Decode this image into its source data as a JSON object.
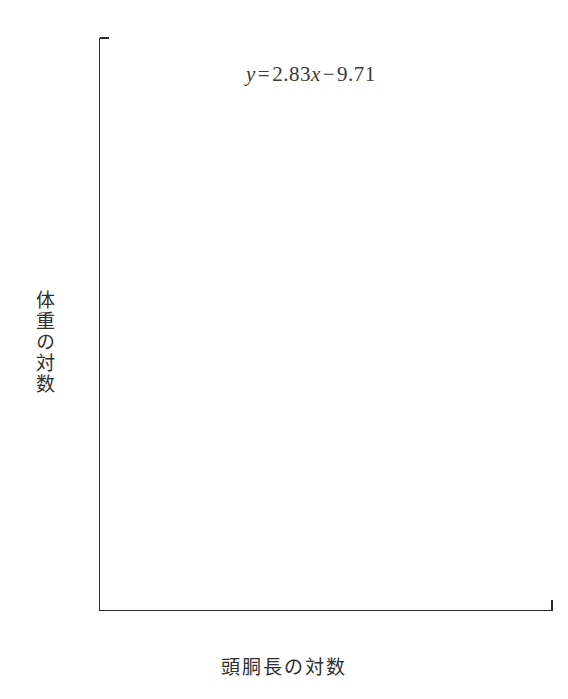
{
  "figure": {
    "width": 568,
    "height": 699,
    "background": "#ffffff",
    "ink_color": "#131313"
  },
  "annotation": {
    "equation_full": "y = 2.83x − 9.71",
    "lhs": "y",
    "equals": "=",
    "slope": "2.83",
    "variable": "x",
    "minus": "−",
    "intercept": "9.71"
  },
  "chart_data": {
    "type": "scatter",
    "title": "",
    "subtitle": "",
    "xlabel": "頭胴長の対数",
    "ylabel": "体重の対数",
    "xlim": [
      4.23,
      6.05
    ],
    "ylim": [
      2.76,
      7.43
    ],
    "grid": false,
    "legend": null,
    "xticks": [
      4.5,
      5.0,
      5.5,
      6.0
    ],
    "xtick_labels": [
      "4.5",
      "5.0",
      "5.5",
      "6.0"
    ],
    "yticks": [
      3.0,
      4.0,
      5.0,
      6.0,
      7.0
    ],
    "ytick_labels": [
      "3.0",
      "4.0",
      "5.0",
      "6.0",
      "7.0"
    ],
    "x_minor_ticks": [
      4.25,
      4.75,
      5.25,
      5.75
    ],
    "y_minor_ticks": [
      3.5,
      4.5,
      5.5,
      6.5
    ],
    "tick_direction": "out",
    "annotations": [
      {
        "text": "y = 2.83x − 9.71",
        "x": 5.05,
        "y": 7.12
      }
    ],
    "fit_line": {
      "equation": "y = 2.83x - 9.71",
      "slope": 2.83,
      "intercept": -9.71,
      "x_start": 4.4,
      "x_end": 5.98,
      "y_start": 2.78,
      "y_end": 7.22,
      "color": "#131313",
      "width": 3.1
    },
    "series": [
      {
        "name": "observations",
        "marker": "circle",
        "marker_size": 4.2,
        "color": "#0d0d0d",
        "points": [
          [
            4.4,
            3.0
          ],
          [
            4.55,
            3.26
          ],
          [
            4.6,
            3.23
          ],
          [
            4.8,
            3.7
          ],
          [
            4.87,
            3.82
          ],
          [
            4.88,
            4.04
          ],
          [
            4.96,
            4.13
          ],
          [
            5.05,
            4.91
          ],
          [
            5.06,
            4.88
          ],
          [
            5.08,
            4.7
          ],
          [
            5.22,
            5.19
          ],
          [
            5.26,
            5.35
          ],
          [
            5.3,
            5.34
          ],
          [
            5.4,
            5.44
          ],
          [
            5.41,
            5.52
          ],
          [
            5.43,
            5.62
          ],
          [
            5.47,
            5.99
          ],
          [
            5.55,
            5.63
          ],
          [
            5.62,
            5.89
          ],
          [
            5.7,
            6.41
          ],
          [
            5.77,
            6.48
          ],
          [
            5.79,
            6.59
          ],
          [
            5.8,
            7.0
          ],
          [
            5.84,
            6.91
          ],
          [
            5.86,
            7.0
          ],
          [
            5.87,
            7.01
          ],
          [
            5.88,
            6.84
          ],
          [
            5.9,
            7.08
          ],
          [
            5.91,
            6.93
          ],
          [
            5.92,
            7.13
          ],
          [
            5.93,
            7.16
          ],
          [
            5.94,
            7.1
          ],
          [
            5.95,
            7.17
          ],
          [
            5.96,
            7.12
          ],
          [
            5.97,
            7.2
          ],
          [
            5.98,
            7.22
          ]
        ]
      }
    ]
  }
}
